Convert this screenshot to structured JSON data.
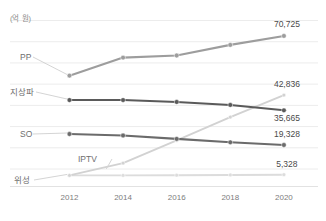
{
  "chart_data": {
    "type": "line",
    "title": "",
    "subtitle": "",
    "xlabel": "",
    "ylabel": "",
    "unit_label": "(억 원)",
    "categories": [
      "2012",
      "2014",
      "2016",
      "2018",
      "2020"
    ],
    "x": [
      2012,
      2014,
      2016,
      2018,
      2020
    ],
    "xlim": [
      2011.2,
      2020.6
    ],
    "ylim": [
      0,
      82000
    ],
    "grid": "horizontal",
    "legend_position": "inline-leader-labels",
    "series": [
      {
        "name": "PP",
        "label": "PP",
        "color": "#9d9d9d",
        "values": [
          52000,
          60500,
          61500,
          66500,
          70725
        ],
        "end_value_label": "70,725",
        "marker": "circle"
      },
      {
        "name": "지상파",
        "label": "지상파",
        "color": "#5a5a5a",
        "values": [
          40500,
          40500,
          39600,
          38200,
          35665
        ],
        "end_value_label": "35,665",
        "marker": "circle"
      },
      {
        "name": "IPTV",
        "label": "IPTV",
        "color": "#d2d2d2",
        "values": [
          5000,
          10800,
          21500,
          32500,
          42836
        ],
        "end_value_label": "42,836",
        "marker": "circle"
      },
      {
        "name": "SO",
        "label": "SO",
        "color": "#6b6b6b",
        "values": [
          24500,
          23800,
          22200,
          20600,
          19328
        ],
        "end_value_label": "19,328",
        "marker": "circle"
      },
      {
        "name": "위성",
        "label": "위성",
        "color": "#dcdcdc",
        "values": [
          5000,
          5000,
          5100,
          5200,
          5328
        ],
        "end_value_label": "5,328",
        "marker": "circle"
      }
    ],
    "gridline_values": [
      78000,
      68000,
      58000,
      48000,
      38000,
      28000,
      18000,
      8000
    ],
    "end_labels": [
      "70,725",
      "42,836",
      "35,665",
      "19,328",
      "5,328"
    ]
  }
}
